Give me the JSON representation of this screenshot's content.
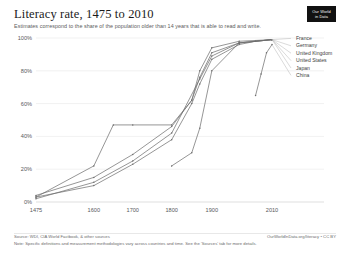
{
  "header": {
    "title": "Literacy rate, 1475 to 2010",
    "subtitle": "Estimates correspond to the share of the population older than 14 years that is able to read and write.",
    "logo_line1": "Our World",
    "logo_line2": "in Data"
  },
  "footer": {
    "source": "Source: WDI, CIA World Factbook, & other sources",
    "license": "OurWorldInData.org/literacy • CC BY",
    "note": "Note: Specific definitions and measurement methodologies vary across countries and time. See the 'Sources' tab for more details."
  },
  "colors": {
    "line": "#6d6d6d",
    "grid": "#e3e3e3",
    "axis": "#c9c9c9",
    "text": "#1d1d1d",
    "muted": "#58595b",
    "logo_bg": "#111111"
  },
  "chart_data": {
    "type": "line",
    "title": "Literacy rate, 1475 to 2010",
    "subtitle": "Estimates correspond to the share of the population older than 14 years that is able to read and write.",
    "xlabel": "",
    "ylabel": "",
    "xlim": [
      1475,
      2010
    ],
    "ylim": [
      0,
      100
    ],
    "yunit": "%",
    "grid": true,
    "legend_position": "right",
    "xticks": [
      1475,
      1600,
      1700,
      1800,
      1900,
      2010
    ],
    "xtick_labels": [
      "1475",
      "1600",
      "1700",
      "1800",
      "1900",
      "2010"
    ],
    "yticks": [
      0,
      20,
      40,
      60,
      80,
      100
    ],
    "ytick_labels": [
      "0%",
      "20%",
      "40%",
      "60%",
      "80%",
      "100%"
    ],
    "series": [
      {
        "name": "France",
        "x": [
          1475,
          1600,
          1700,
          1800,
          1850,
          1870,
          1900,
          1950,
          1980,
          2010
        ],
        "y": [
          3,
          10,
          23,
          38,
          60,
          72,
          87,
          96,
          98,
          99
        ]
      },
      {
        "name": "Germany",
        "x": [
          1475,
          1600,
          1650,
          1700,
          1800,
          1850,
          1870,
          1900,
          1950,
          2010
        ],
        "y": [
          3,
          22,
          47,
          47,
          47,
          62,
          80,
          94,
          98,
          99
        ]
      },
      {
        "name": "United Kingdom",
        "x": [
          1475,
          1600,
          1700,
          1800,
          1850,
          1870,
          1900,
          1950,
          2010
        ],
        "y": [
          4,
          15,
          29,
          46,
          62,
          76,
          91,
          97,
          99
        ]
      },
      {
        "name": "United States",
        "x": [
          1475,
          1600,
          1700,
          1800,
          1870,
          1900,
          1950,
          2010
        ],
        "y": [
          2,
          12,
          25,
          42,
          75,
          89,
          97,
          99
        ]
      },
      {
        "name": "Japan",
        "x": [
          1800,
          1850,
          1870,
          1900,
          1950,
          2010
        ],
        "y": [
          22,
          30,
          45,
          80,
          97,
          99
        ]
      },
      {
        "name": "China",
        "x": [
          1980,
          1990,
          2000,
          2010
        ],
        "y": [
          65,
          78,
          91,
          96
        ]
      }
    ],
    "legend": [
      "France",
      "Germany",
      "United Kingdom",
      "United States",
      "Japan",
      "China"
    ]
  }
}
